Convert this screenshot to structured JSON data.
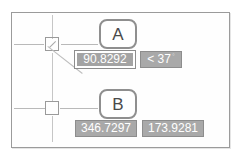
{
  "app": {
    "context": "cad-dynamic-input-tooltip"
  },
  "frame": {
    "label": "drawing-area"
  },
  "markers": [
    {
      "id": "A",
      "label": "A"
    },
    {
      "id": "B",
      "label": "B"
    }
  ],
  "rows": [
    {
      "marker": "A",
      "fields": [
        {
          "name": "distance-field",
          "value": "90.8292",
          "active": true,
          "suffix": ""
        },
        {
          "name": "angle-field",
          "value": "< 37",
          "active": false,
          "suffix": "°"
        }
      ]
    },
    {
      "marker": "B",
      "fields": [
        {
          "name": "x-coordinate-field",
          "value": "346.7297",
          "active": false,
          "suffix": ""
        },
        {
          "name": "y-coordinate-field",
          "value": "173.9281",
          "active": false,
          "suffix": ""
        }
      ]
    }
  ],
  "colors": {
    "field_fill": "#a9a9a9",
    "field_text": "#ffffff",
    "marker_border": "#8f8f8f",
    "crosshair": "#bdbdbd",
    "frame_border": "#9b9b9b"
  },
  "cursors": [
    {
      "name": "crosshair-cursor-a",
      "has_snap_marker": true,
      "has_rubber_band": true
    },
    {
      "name": "crosshair-cursor-b",
      "has_snap_marker": false,
      "has_rubber_band": false
    }
  ]
}
